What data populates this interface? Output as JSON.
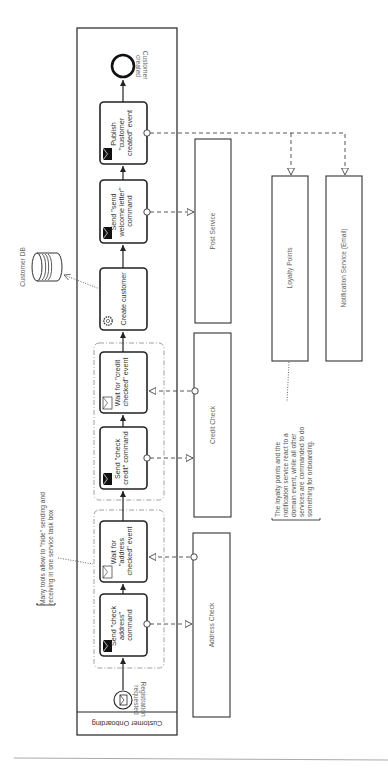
{
  "pool": {
    "label": "Customer Onboarding"
  },
  "start_event": {
    "label_lines": [
      "Registration",
      "requested"
    ]
  },
  "end_event": {
    "label_lines": [
      "Customer",
      "created"
    ]
  },
  "tasks": [
    {
      "id": "send-check-address",
      "type": "send",
      "label_lines": [
        "Send \"check",
        "address\"",
        "command"
      ]
    },
    {
      "id": "wait-address-checked",
      "type": "receive",
      "label_lines": [
        "Wait for",
        "\"address",
        "checked\" event"
      ]
    },
    {
      "id": "send-check-credit",
      "type": "send",
      "label_lines": [
        "Send \"check",
        "credit\" command"
      ]
    },
    {
      "id": "wait-credit-checked",
      "type": "receive",
      "label_lines": [
        "Wait for \"credit",
        "checked\" event"
      ]
    },
    {
      "id": "create-customer",
      "type": "service",
      "label_lines": [
        "Create customer"
      ]
    },
    {
      "id": "send-welcome-letter",
      "type": "send",
      "label_lines": [
        "Send \"send",
        "welcome letter\"",
        "command"
      ]
    },
    {
      "id": "publish-customer-created",
      "type": "send",
      "label_lines": [
        "Publish",
        "\"customer",
        "created\" event"
      ]
    }
  ],
  "external_participants": [
    {
      "id": "address-check",
      "label": "Address Check"
    },
    {
      "id": "credit-check",
      "label": "Credit Check"
    },
    {
      "id": "post-service",
      "label": "Post Service"
    },
    {
      "id": "loyalty-points",
      "label": "Loyalty Points"
    },
    {
      "id": "notification-service",
      "label": "Notification Service (Email)"
    }
  ],
  "data_store": {
    "label": "Customer DB"
  },
  "annotations": [
    {
      "id": "tools-note",
      "label_lines": [
        "Many tools allow to \"hide\" sending and",
        "receiving in one service task box"
      ]
    },
    {
      "id": "events-note",
      "label_lines": [
        "The loyalty points and the",
        "notification service react to a",
        "domain event, while all other",
        "services are commanded to do",
        "something for onboarding."
      ]
    }
  ]
}
